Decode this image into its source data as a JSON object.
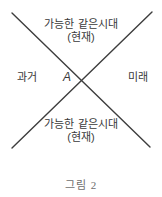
{
  "diagram": {
    "top_label": {
      "line1": "가능한 같은시대",
      "line2": "(현재)"
    },
    "left_label": "과거",
    "center_label": "A",
    "right_label": "미래",
    "bottom_label": {
      "line1": "가능한 같은시대",
      "line2": "(현재)"
    },
    "caption": "그림 2",
    "colors": {
      "background": "#ffffff",
      "line": "#3d3d3d",
      "text": "#3a3a3a",
      "caption": "#6e6e6e"
    }
  }
}
